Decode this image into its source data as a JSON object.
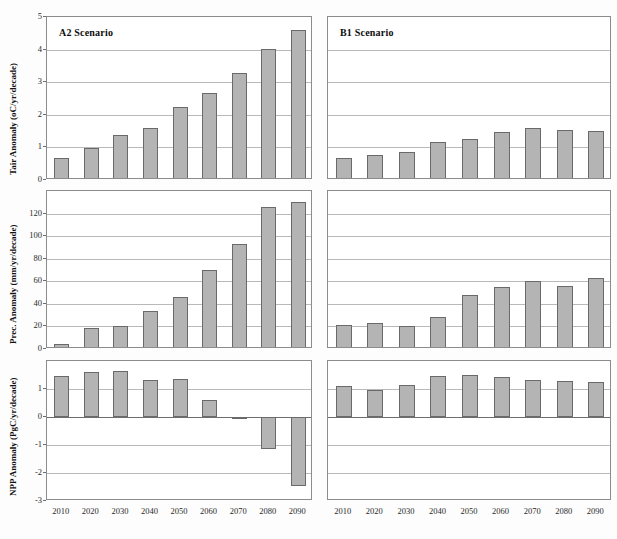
{
  "figure": {
    "columns": [
      {
        "id": "A2",
        "title": "A2 Scenario"
      },
      {
        "id": "B1",
        "title": "B1 Scenario"
      }
    ],
    "categories": [
      "2010",
      "2020",
      "2030",
      "2040",
      "2050",
      "2060",
      "2070",
      "2080",
      "2090"
    ],
    "bar_fill": "#b4b4b4",
    "bar_stroke": "#6a6a6a",
    "grid_color": "#b9b9b9",
    "frame_color": "#8c8c8c"
  },
  "rows": [
    {
      "id": "tair",
      "ylabel": "Tair Anomaly (oC/yr/decade)",
      "yticks": [
        "0",
        "1",
        "2",
        "3",
        "4",
        "5"
      ],
      "ylim": [
        0,
        5
      ]
    },
    {
      "id": "prec",
      "ylabel": "Prec. Anomaly (mm/yr/decade)",
      "yticks": [
        "0",
        "20",
        "40",
        "60",
        "80",
        "100",
        "120"
      ],
      "ylim": [
        0,
        140
      ]
    },
    {
      "id": "npp",
      "ylabel": "NPP Anomaly (PgC/yr/decade)",
      "yticks": [
        "-3",
        "-2",
        "-1",
        "0",
        "1"
      ],
      "ylim": [
        -3,
        2
      ]
    }
  ],
  "chart_data": [
    {
      "type": "bar",
      "panel": "A2-tair",
      "title": "A2 Scenario",
      "xlabel": "",
      "ylabel": "Tair Anomaly (oC/yr/decade)",
      "categories": [
        "2010",
        "2020",
        "2030",
        "2040",
        "2050",
        "2060",
        "2070",
        "2080",
        "2090"
      ],
      "values": [
        0.67,
        0.97,
        1.39,
        1.58,
        2.25,
        2.68,
        3.28,
        4.02,
        4.6
      ],
      "ylim": [
        0,
        5
      ],
      "yticks": [
        0,
        1,
        2,
        3,
        4,
        5
      ],
      "grid": true,
      "legend": "none"
    },
    {
      "type": "bar",
      "panel": "B1-tair",
      "title": "B1 Scenario",
      "xlabel": "",
      "ylabel": "Tair Anomaly (oC/yr/decade)",
      "categories": [
        "2010",
        "2020",
        "2030",
        "2040",
        "2050",
        "2060",
        "2070",
        "2080",
        "2090"
      ],
      "values": [
        0.68,
        0.78,
        0.85,
        1.17,
        1.25,
        1.48,
        1.58,
        1.52,
        1.5
      ],
      "ylim": [
        0,
        5
      ],
      "yticks": [
        0,
        1,
        2,
        3,
        4,
        5
      ],
      "grid": true,
      "legend": "none"
    },
    {
      "type": "bar",
      "panel": "A2-prec",
      "title": "",
      "xlabel": "",
      "ylabel": "Prec. Anomaly (mm/yr/decade)",
      "categories": [
        "2010",
        "2020",
        "2030",
        "2040",
        "2050",
        "2060",
        "2070",
        "2080",
        "2090"
      ],
      "values": [
        4,
        19,
        20.5,
        34,
        46.5,
        70,
        93,
        126,
        130
      ],
      "ylim": [
        0,
        140
      ],
      "yticks": [
        0,
        20,
        40,
        60,
        80,
        100,
        120
      ],
      "grid": true,
      "legend": "none"
    },
    {
      "type": "bar",
      "panel": "B1-prec",
      "title": "",
      "xlabel": "",
      "ylabel": "Prec. Anomaly (mm/yr/decade)",
      "categories": [
        "2010",
        "2020",
        "2030",
        "2040",
        "2050",
        "2060",
        "2070",
        "2080",
        "2090"
      ],
      "values": [
        21,
        23,
        20,
        28,
        48,
        55,
        60,
        56,
        63
      ],
      "ylim": [
        0,
        140
      ],
      "yticks": [
        0,
        20,
        40,
        60,
        80,
        100,
        120
      ],
      "grid": true,
      "legend": "none"
    },
    {
      "type": "bar",
      "panel": "A2-npp",
      "title": "",
      "xlabel": "",
      "ylabel": "NPP Anomaly (PgC/yr/decade)",
      "categories": [
        "2010",
        "2020",
        "2030",
        "2040",
        "2050",
        "2060",
        "2070",
        "2080",
        "2090"
      ],
      "values": [
        1.45,
        1.62,
        1.65,
        1.32,
        1.35,
        0.62,
        -0.05,
        -1.15,
        -2.48
      ],
      "ylim": [
        -3,
        2
      ],
      "yticks": [
        -3,
        -2,
        -1,
        0,
        1
      ],
      "grid": true,
      "legend": "none"
    },
    {
      "type": "bar",
      "panel": "B1-npp",
      "title": "",
      "xlabel": "",
      "ylabel": "NPP Anomaly (PgC/yr/decade)",
      "categories": [
        "2010",
        "2020",
        "2030",
        "2040",
        "2050",
        "2060",
        "2070",
        "2080",
        "2090"
      ],
      "values": [
        1.1,
        0.95,
        1.14,
        1.45,
        1.5,
        1.43,
        1.32,
        1.28,
        1.24
      ],
      "ylim": [
        -3,
        2
      ],
      "yticks": [
        -3,
        -2,
        -1,
        0,
        1
      ],
      "grid": true,
      "legend": "none"
    }
  ]
}
